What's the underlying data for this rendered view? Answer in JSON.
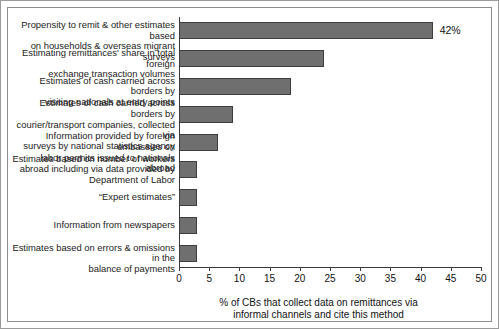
{
  "chart_data": {
    "type": "bar",
    "orientation": "horizontal",
    "title": "",
    "xlabel": "% of CBs that collect data on remittances via\ninformal channels and cite this method",
    "ylabel": "",
    "xlim": [
      0,
      50
    ],
    "xticks": [
      0,
      5,
      10,
      15,
      20,
      25,
      30,
      35,
      40,
      45,
      50
    ],
    "grid": false,
    "legend": null,
    "bar_color": "#6f6f6f",
    "bar_edge_color": "#3d3d3d",
    "categories": [
      "Propensity to remit & other estimates based\non households & overseas migrant surveys",
      "Estimating remittances' share in total foreign\nexchange transaction volumes",
      "Estimates of cash carried across borders by\nvisiting nationals at entry points",
      "Estimates of cash carried across borders by\ncourier/transport companies, collected via\nsurveys by national statistics agency",
      "Information provided by foreign embassies on\nlabor permits issued to nationals abroad",
      "Estimates based on number of workers\nabroad including via data provided by\nDepartment of Labor",
      "“Expert estimates”",
      "Information from newspapers",
      "Estimates based on errors & omissions in the\nbalance of payments"
    ],
    "values": [
      42,
      24,
      18.5,
      9,
      6.5,
      3,
      3,
      3,
      3
    ],
    "data_labels": [
      "42%",
      "",
      "",
      "",
      "",
      "",
      "",
      "",
      ""
    ]
  }
}
